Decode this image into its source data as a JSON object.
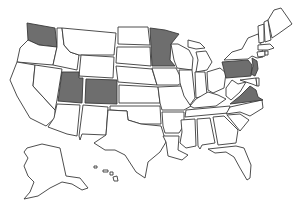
{
  "map": {
    "title": "United States map with highlighted states",
    "highlight_color": "#6e6e6e",
    "base_color": "#ffffff",
    "stroke_color": "#3a3a3a",
    "highlighted_states": [
      "Washington",
      "Utah",
      "Colorado",
      "Minnesota",
      "Pennsylvania",
      "New Jersey",
      "Virginia"
    ],
    "states": [
      {
        "id": "WA",
        "name": "Washington",
        "selected": true,
        "points": "27,23 55,28 57,47 39,45 28,40"
      },
      {
        "id": "OR",
        "name": "Oregon",
        "selected": false,
        "points": "28,40 39,45 57,47 53,65 17,62 20,48"
      },
      {
        "id": "CA",
        "name": "California",
        "selected": false,
        "points": "17,62 35,65 33,86 55,110 55,118 46,126 30,118 17,96 10,80"
      },
      {
        "id": "NV",
        "name": "Nevada",
        "selected": false,
        "points": "35,65 62,69 57,100 55,110 33,86"
      },
      {
        "id": "ID",
        "name": "Idaho",
        "selected": false,
        "points": "57,28 62,28 64,45 70,52 79,55 77,70 53,65 57,47"
      },
      {
        "id": "MT",
        "name": "Montana",
        "selected": false,
        "points": "62,28 116,33 114,55 79,55 70,52 64,45"
      },
      {
        "id": "WY",
        "name": "Wyoming",
        "selected": false,
        "points": "81,55 114,57 113,78 79,76"
      },
      {
        "id": "UT",
        "name": "Utah",
        "selected": true,
        "points": "62,72 79,72 79,78 83,78 82,103 58,101"
      },
      {
        "id": "CO",
        "name": "Colorado",
        "selected": true,
        "points": "86,79 117,80 117,104 85,103"
      },
      {
        "id": "AZ",
        "name": "Arizona",
        "selected": false,
        "points": "57,104 80,105 77,136 67,134 48,127 54,118"
      },
      {
        "id": "NM",
        "name": "New Mexico",
        "selected": false,
        "points": "83,105 108,107 106,135 82,134 80,140 79,136"
      },
      {
        "id": "ND",
        "name": "North Dakota",
        "selected": false,
        "points": "118,27 148,27 150,45 118,44"
      },
      {
        "id": "SD",
        "name": "South Dakota",
        "selected": false,
        "points": "117,47 150,47 151,66 116,63"
      },
      {
        "id": "NE",
        "name": "Nebraska",
        "selected": false,
        "points": "116,66 152,69 157,85 118,82"
      },
      {
        "id": "KS",
        "name": "Kansas",
        "selected": false,
        "points": "119,85 158,87 160,103 119,103"
      },
      {
        "id": "OK",
        "name": "Oklahoma",
        "selected": false,
        "points": "110,106 160,106 161,124 141,124 128,120 127,111 110,110"
      },
      {
        "id": "TX",
        "name": "Texas",
        "selected": false,
        "points": "108,110 127,111 128,120 141,124 161,126 166,142 160,152 148,162 145,178 136,172 125,155 115,150 105,150 94,143 106,135"
      },
      {
        "id": "MN",
        "name": "Minnesota",
        "selected": true,
        "points": "150,28 165,30 179,34 171,44 170,60 175,66 152,66"
      },
      {
        "id": "IA",
        "name": "Iowa",
        "selected": false,
        "points": "152,68 176,68 183,82 178,85 157,85"
      },
      {
        "id": "MO",
        "name": "Missouri",
        "selected": false,
        "points": "158,87 181,86 186,98 191,106 184,110 162,110 160,103"
      },
      {
        "id": "AR",
        "name": "Arkansas",
        "selected": false,
        "points": "162,112 184,112 184,125 179,133 165,133 163,126"
      },
      {
        "id": "LA",
        "name": "Louisiana",
        "selected": false,
        "points": "163,136 179,136 178,150 188,155 182,160 168,156 166,142"
      },
      {
        "id": "WI",
        "name": "Wisconsin",
        "selected": false,
        "points": "171,44 178,44 189,50 193,58 192,70 177,68 174,60"
      },
      {
        "id": "IL",
        "name": "Illinois",
        "selected": false,
        "points": "179,70 192,70 195,98 190,105 184,96 180,83"
      },
      {
        "id": "MI",
        "name": "Michigan",
        "selected": false,
        "points": "188,40 200,43 205,48 196,49 188,47 M196,52 206,51 212,62 207,70 196,72 198,60"
      },
      {
        "id": "IN",
        "name": "Indiana",
        "selected": false,
        "points": "195,72 205,72 207,95 196,98"
      },
      {
        "id": "OH",
        "name": "Ohio",
        "selected": false,
        "points": "207,72 220,68 226,73 224,88 213,93 208,90"
      },
      {
        "id": "KY",
        "name": "Kentucky",
        "selected": false,
        "points": "190,106 196,99 208,92 218,95 226,99 216,106 194,108"
      },
      {
        "id": "TN",
        "name": "Tennessee",
        "selected": false,
        "points": "186,110 230,106 228,113 185,117"
      },
      {
        "id": "MS",
        "name": "Mississippi",
        "selected": false,
        "points": "181,120 195,119 196,146 186,148 180,143 182,132"
      },
      {
        "id": "AL",
        "name": "Alabama",
        "selected": false,
        "points": "197,119 210,118 215,143 202,145 200,149 198,146"
      },
      {
        "id": "GA",
        "name": "Georgia",
        "selected": false,
        "points": "213,117 224,116 238,130 236,143 218,145"
      },
      {
        "id": "FL",
        "name": "Florida",
        "selected": false,
        "points": "208,149 236,146 244,148 251,165 250,178 247,180 240,168 234,157 226,152 215,153"
      },
      {
        "id": "SC",
        "name": "South Carolina",
        "selected": false,
        "points": "227,115 240,114 249,120 240,131"
      },
      {
        "id": "NC",
        "name": "North Carolina",
        "selected": false,
        "points": "230,107 262,100 263,108 250,116 240,112 226,114"
      },
      {
        "id": "VA",
        "name": "Virginia",
        "selected": true,
        "points": "230,104 240,96 250,86 256,90 258,97 263,100"
      },
      {
        "id": "WV",
        "name": "West Virginia",
        "selected": false,
        "points": "226,88 232,80 238,84 246,82 240,92 231,100 226,96"
      },
      {
        "id": "MD",
        "name": "Maryland",
        "selected": false,
        "points": "240,80 256,78 257,86 252,84 246,82"
      },
      {
        "id": "DE",
        "name": "Delaware",
        "selected": false,
        "points": "256,78 259,78 259,86 257,86"
      },
      {
        "id": "PA",
        "name": "Pennsylvania",
        "selected": true,
        "points": "222,62 248,60 252,65 251,76 226,78"
      },
      {
        "id": "NJ",
        "name": "New Jersey",
        "selected": true,
        "points": "252,58 257,61 258,69 255,76 251,74 253,66"
      },
      {
        "id": "NY",
        "name": "New York",
        "selected": false,
        "points": "224,60 232,52 242,49 248,38 258,34 262,48 263,57 257,58 252,56 248,59"
      },
      {
        "id": "CT",
        "name": "Connecticut",
        "selected": false,
        "points": "257,52 265,51 265,56 258,57"
      },
      {
        "id": "RI",
        "name": "Rhode Island",
        "selected": false,
        "points": "265,51 268,51 268,55 265,55"
      },
      {
        "id": "MA",
        "name": "Massachusetts",
        "selected": false,
        "points": "258,45 270,44 274,48 268,50 258,50"
      },
      {
        "id": "VT",
        "name": "Vermont",
        "selected": false,
        "points": "258,26 264,24 264,42 259,43"
      },
      {
        "id": "NH",
        "name": "New Hampshire",
        "selected": false,
        "points": "264,22 268,20 271,40 265,42"
      },
      {
        "id": "ME",
        "name": "Maine",
        "selected": false,
        "points": "268,20 274,10 281,8 288,18 292,24 278,34 272,38"
      },
      {
        "id": "AK",
        "name": "Alaska",
        "selected": false,
        "points": "27,148 42,144 60,148 66,176 80,178 88,188 82,190 72,184 62,182 50,188 38,196 24,199 30,192 34,182 28,176 24,166 28,158 24,152"
      },
      {
        "id": "HI",
        "name": "Hawaii",
        "selected": false,
        "points": "94,166 97,166 97,168 94,168 M103,170 108,170 108,172 103,172 M110,172 113,172 113,175 110,175 M113,177 117,176 118,181 114,181"
      }
    ]
  }
}
